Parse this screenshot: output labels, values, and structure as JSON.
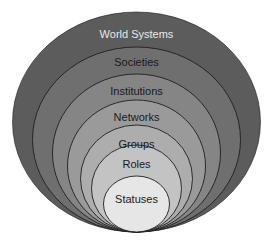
{
  "diagram": {
    "levels": [
      {
        "label": "World Systems",
        "fill": "#5c5c5c",
        "text_color": "#e8e8e8",
        "cx": 136.5,
        "rx": 124,
        "top": 12,
        "label_y": 34
      },
      {
        "label": "Societies",
        "fill": "#6f6f6f",
        "text_color": "#1a1a1a",
        "cx": 136.5,
        "rx": 104,
        "top": 47,
        "label_y": 62
      },
      {
        "label": "Institutions",
        "fill": "#858585",
        "text_color": "#1a1a1a",
        "cx": 136.5,
        "rx": 84,
        "top": 74,
        "label_y": 91
      },
      {
        "label": "Networks",
        "fill": "#9a9a9a",
        "text_color": "#1a1a1a",
        "cx": 136.5,
        "rx": 69,
        "top": 100,
        "label_y": 117
      },
      {
        "label": "Groups",
        "fill": "#adadad",
        "text_color": "#1a1a1a",
        "cx": 136.5,
        "rx": 56,
        "top": 125,
        "label_y": 144
      },
      {
        "label": "Roles",
        "fill": "#c3c3c3",
        "text_color": "#1a1a1a",
        "cx": 136.5,
        "rx": 45,
        "top": 145,
        "label_y": 164
      },
      {
        "label": "Statuses",
        "fill": "#e6e6e6",
        "text_color": "#1a1a1a",
        "cx": 136.5,
        "rx": 33,
        "top": 176,
        "label_y": 199
      }
    ],
    "bottom": 232,
    "stroke": "#1e1e1e"
  }
}
